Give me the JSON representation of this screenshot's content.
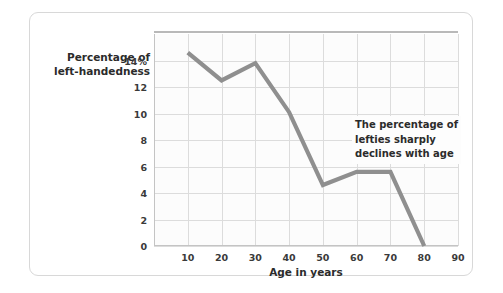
{
  "chart_data": {
    "type": "line",
    "title": "",
    "subtitle": "",
    "xlabel": "Age in years",
    "ylabel_lines": [
      "Percentage of",
      "left-handedness"
    ],
    "ylabel": "Percentage of left-handedness",
    "x": [
      10,
      20,
      30,
      40,
      50,
      60,
      70,
      80
    ],
    "values": [
      14.6,
      12.5,
      13.8,
      10.1,
      4.6,
      5.6,
      5.6,
      0.0
    ],
    "series": [
      {
        "name": "Percentage of left-handedness",
        "values": [
          14.6,
          12.5,
          13.8,
          10.1,
          4.6,
          5.6,
          5.6,
          0.0
        ],
        "color": "#8f8f8f"
      }
    ],
    "xlim": [
      0,
      90
    ],
    "ylim": [
      0,
      16
    ],
    "xticks": [
      10,
      20,
      30,
      40,
      50,
      60,
      70,
      80,
      90
    ],
    "xtick_labels": [
      "10",
      "20",
      "30",
      "40",
      "50",
      "60",
      "70",
      "80",
      "90"
    ],
    "yticks": [
      0,
      2,
      4,
      6,
      8,
      10,
      12,
      14
    ],
    "ytick_labels": [
      "0",
      "2",
      "4",
      "6",
      "8",
      "10",
      "12",
      "14%"
    ],
    "grid": true,
    "legend": "none",
    "annotations": [
      {
        "lines": [
          "The percentage of",
          "lefties sharply",
          "declines with age"
        ],
        "text": "The percentage of lefties sharply declines with age",
        "x": 57,
        "y": 9.2
      }
    ],
    "colors": {
      "line": "#8f8f8f",
      "grid": "#dcdcdc",
      "axis": "#c4c4c4",
      "plot_background": "#fcfcfc",
      "card_border": "#d8d8d8",
      "text": "#2b2b2b"
    }
  }
}
